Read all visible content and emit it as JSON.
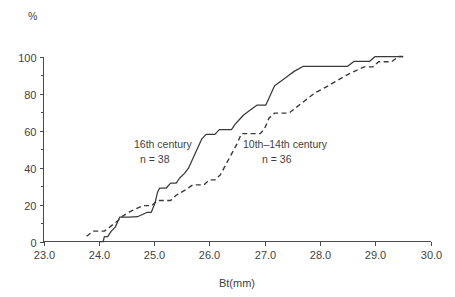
{
  "chart_data": {
    "type": "line",
    "title": "",
    "subtitle": "",
    "xlabel": "Bt(mm)",
    "ylabel": "%",
    "xlim": [
      23.0,
      30.0
    ],
    "ylim": [
      0,
      100
    ],
    "grid": false,
    "legend_position": "inline-annotation",
    "x_ticks": [
      "23.0",
      "24.0",
      "25.0",
      "26.0",
      "27.0",
      "28.0",
      "29.0",
      "30.0"
    ],
    "x_tick_values": [
      23.0,
      24.0,
      25.0,
      26.0,
      27.0,
      28.0,
      29.0,
      30.0
    ],
    "x_minor_tick_values": [
      23.5,
      24.5,
      25.5,
      26.5,
      27.5,
      28.5,
      29.5
    ],
    "y_ticks": [
      "0",
      "20",
      "40",
      "60",
      "80",
      "100"
    ],
    "y_tick_values": [
      0,
      20,
      40,
      60,
      80,
      100
    ],
    "y_minor_tick_values": [
      10,
      30,
      50,
      70,
      90
    ],
    "series": [
      {
        "name": "16th century",
        "style": "solid",
        "n_label": "n = 38",
        "annotation_x": 26.0,
        "points": [
          [
            24.02,
            0
          ],
          [
            24.08,
            0
          ],
          [
            24.1,
            2.6
          ],
          [
            24.16,
            2.6
          ],
          [
            24.22,
            5.3
          ],
          [
            24.3,
            7.9
          ],
          [
            24.38,
            13.2
          ],
          [
            24.55,
            13.2
          ],
          [
            24.7,
            13.4
          ],
          [
            24.88,
            15.8
          ],
          [
            24.95,
            15.8
          ],
          [
            25.02,
            21.1
          ],
          [
            25.06,
            26.3
          ],
          [
            25.1,
            28.9
          ],
          [
            25.22,
            28.9
          ],
          [
            25.3,
            31.6
          ],
          [
            25.4,
            31.6
          ],
          [
            25.46,
            34.2
          ],
          [
            25.55,
            36.8
          ],
          [
            25.62,
            39.5
          ],
          [
            25.7,
            44.7
          ],
          [
            25.78,
            50.0
          ],
          [
            25.86,
            55.3
          ],
          [
            25.94,
            57.9
          ],
          [
            26.1,
            57.9
          ],
          [
            26.18,
            60.5
          ],
          [
            26.4,
            60.5
          ],
          [
            26.46,
            63.2
          ],
          [
            26.54,
            65.8
          ],
          [
            26.62,
            68.4
          ],
          [
            26.74,
            71.1
          ],
          [
            26.86,
            73.7
          ],
          [
            27.02,
            73.7
          ],
          [
            27.1,
            78.9
          ],
          [
            27.18,
            84.2
          ],
          [
            27.3,
            86.8
          ],
          [
            27.42,
            89.5
          ],
          [
            27.54,
            92.1
          ],
          [
            27.7,
            94.7
          ],
          [
            27.86,
            94.7
          ],
          [
            28.3,
            94.7
          ],
          [
            28.5,
            94.7
          ],
          [
            28.62,
            97.4
          ],
          [
            28.9,
            97.4
          ],
          [
            29.0,
            100
          ],
          [
            29.2,
            100
          ],
          [
            29.5,
            100
          ]
        ]
      },
      {
        "name": "10th–14th century",
        "style": "dashed",
        "n_label": "n = 36",
        "annotation_x": 27.7,
        "points": [
          [
            23.78,
            2.8
          ],
          [
            23.9,
            5.6
          ],
          [
            24.1,
            5.6
          ],
          [
            24.22,
            8.3
          ],
          [
            24.34,
            11.1
          ],
          [
            24.44,
            13.9
          ],
          [
            24.6,
            16.7
          ],
          [
            24.8,
            19.4
          ],
          [
            24.96,
            19.4
          ],
          [
            25.06,
            22.2
          ],
          [
            25.3,
            22.2
          ],
          [
            25.4,
            25.0
          ],
          [
            25.56,
            27.8
          ],
          [
            25.7,
            30.6
          ],
          [
            25.9,
            30.6
          ],
          [
            26.0,
            33.3
          ],
          [
            26.1,
            33.3
          ],
          [
            26.2,
            36.1
          ],
          [
            26.3,
            41.7
          ],
          [
            26.4,
            47.2
          ],
          [
            26.5,
            52.8
          ],
          [
            26.58,
            58.3
          ],
          [
            26.7,
            58.3
          ],
          [
            26.92,
            58.3
          ],
          [
            27.0,
            61.1
          ],
          [
            27.08,
            66.7
          ],
          [
            27.18,
            69.4
          ],
          [
            27.44,
            69.4
          ],
          [
            27.56,
            72.2
          ],
          [
            27.68,
            75.0
          ],
          [
            27.8,
            77.8
          ],
          [
            27.92,
            80.6
          ],
          [
            28.1,
            83.3
          ],
          [
            28.26,
            86.1
          ],
          [
            28.42,
            88.9
          ],
          [
            28.6,
            91.7
          ],
          [
            28.8,
            94.4
          ],
          [
            28.96,
            94.4
          ],
          [
            29.06,
            97.2
          ],
          [
            29.3,
            97.2
          ],
          [
            29.42,
            100
          ],
          [
            29.5,
            100
          ]
        ]
      }
    ]
  },
  "axes": {
    "y_unit_label": "%",
    "x_axis_title": "Bt(mm)"
  },
  "annotations": [
    {
      "line1": "16th century",
      "line2": "n = 38"
    },
    {
      "line1": "10th–14th century",
      "line2": "n = 36"
    }
  ],
  "colors": {
    "axis": "#4a4a4a",
    "text": "#3f3f3f",
    "series_solid": "#3a3a3a",
    "series_dashed": "#3a3a3a",
    "background": "#ffffff"
  }
}
